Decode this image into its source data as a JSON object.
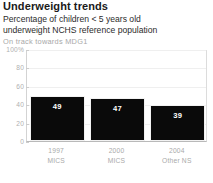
{
  "header": {
    "title": "Underweight trends",
    "subtitle_line1": "Percentage of children < 5 years old",
    "subtitle_line2": "underweight NCHS reference population",
    "status_note": "On track towards MDG1"
  },
  "chart_data": {
    "type": "bar",
    "title": "Underweight trends",
    "subtitle": "Percentage of children < 5 years old underweight NCHS reference population",
    "annotation": "On track towards MDG1",
    "categories": [
      "1997",
      "2000",
      "2004"
    ],
    "category_sublabels": [
      "MICS",
      "MICS",
      "Other NS"
    ],
    "values": [
      49,
      47,
      39
    ],
    "value_labels": [
      "49",
      "47",
      "39"
    ],
    "xlabel": "",
    "ylabel": "",
    "ylim": [
      0,
      100
    ],
    "yticks": [
      0,
      20,
      40,
      60,
      80,
      100
    ],
    "ytick_labels": [
      "0",
      "20",
      "40",
      "60",
      "80",
      "100%"
    ],
    "grid": true,
    "legend": false,
    "bar_color": "#0a0a0a",
    "value_label_color": "#ffffff",
    "axis_label_color": "#a9a9a9"
  }
}
